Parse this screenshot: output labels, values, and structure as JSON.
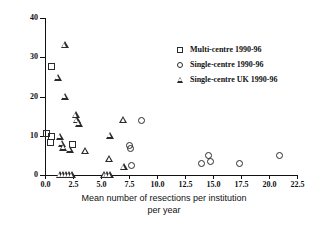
{
  "chart_data": {
    "type": "scatter",
    "title": "",
    "xlabel": "Mean number of resections per institution per year",
    "xlabel_line1": "Mean number of resections per institution",
    "xlabel_line2": "per year",
    "ylabel": "Mortality (%)",
    "xlim": [
      0,
      22.5
    ],
    "ylim": [
      0,
      40
    ],
    "xticks": [
      "0.0",
      "2.5",
      "5.0",
      "7.5",
      "10.0",
      "12.5",
      "15.0",
      "17.5",
      "20.0",
      "22.5"
    ],
    "xtick_values": [
      0,
      2.5,
      5,
      7.5,
      10,
      12.5,
      15,
      17.5,
      20,
      22.5
    ],
    "yticks": [
      "0",
      "10",
      "20",
      "30",
      "40"
    ],
    "ytick_values": [
      0,
      10,
      20,
      30,
      40
    ],
    "grid": false,
    "legend_position": "upper-right-inside",
    "marker_color": "#2b2b2b",
    "series": [
      {
        "name": "Multi-centre 1990-96",
        "marker": "square",
        "points": [
          {
            "x": 0.1,
            "y": 10.5
          },
          {
            "x": 0.55,
            "y": 9.7
          },
          {
            "x": 0.45,
            "y": 8.3
          },
          {
            "x": 0.6,
            "y": 27.6
          },
          {
            "x": 2.45,
            "y": 7.7
          }
        ]
      },
      {
        "name": "Single-centre 1990-96",
        "marker": "circle",
        "points": [
          {
            "x": 8.6,
            "y": 14.0
          },
          {
            "x": 7.5,
            "y": 7.5
          },
          {
            "x": 7.6,
            "y": 6.7
          },
          {
            "x": 7.75,
            "y": 2.5
          },
          {
            "x": 14.0,
            "y": 3.0
          },
          {
            "x": 14.6,
            "y": 4.9
          },
          {
            "x": 14.8,
            "y": 3.5
          },
          {
            "x": 17.4,
            "y": 3.0
          },
          {
            "x": 20.9,
            "y": 4.9
          }
        ]
      },
      {
        "name": "Single-centre UK 1990-96",
        "marker": "triangle",
        "points": [
          {
            "x": 1.75,
            "y": 33.0
          },
          {
            "x": 1.15,
            "y": 24.8
          },
          {
            "x": 1.75,
            "y": 20.0
          },
          {
            "x": 2.75,
            "y": 15.2
          },
          {
            "x": 2.85,
            "y": 14.0
          },
          {
            "x": 3.05,
            "y": 13.1
          },
          {
            "x": 1.3,
            "y": 9.8
          },
          {
            "x": 5.8,
            "y": 10.0
          },
          {
            "x": 1.5,
            "y": 8.0
          },
          {
            "x": 1.65,
            "y": 7.0
          },
          {
            "x": 2.2,
            "y": 6.4
          },
          {
            "x": 3.6,
            "y": 6.0
          },
          {
            "x": 5.75,
            "y": 4.0
          },
          {
            "x": 7.05,
            "y": 2.0
          },
          {
            "x": 7.0,
            "y": 14.0
          },
          {
            "x": 1.35,
            "y": 0.0
          },
          {
            "x": 1.6,
            "y": 0.0
          },
          {
            "x": 1.85,
            "y": 0.0
          },
          {
            "x": 2.1,
            "y": 0.0
          },
          {
            "x": 2.4,
            "y": 0.0
          },
          {
            "x": 5.3,
            "y": 0.0
          },
          {
            "x": 5.55,
            "y": 0.0
          },
          {
            "x": 5.8,
            "y": 0.0
          }
        ]
      }
    ]
  },
  "legend": {
    "items": [
      {
        "marker": "square",
        "label": "Multi-centre 1990-96"
      },
      {
        "marker": "circle",
        "label": "Single-centre 1990-96"
      },
      {
        "marker": "triangle",
        "label": "Single-centre UK 1990-96"
      }
    ]
  }
}
